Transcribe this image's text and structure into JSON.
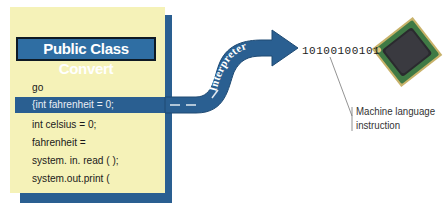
{
  "diagram": {
    "code_panel": {
      "title": "Public Class Convert",
      "lines": [
        "go",
        "{int fahrenheit = 0;",
        "int celsius = 0;",
        "fahrenheit =",
        "system. in. read ( );",
        "system.out.print ("
      ],
      "highlighted_line_index": 1
    },
    "arrow": {
      "label": "Interpreter"
    },
    "output": {
      "binary": "10100100101"
    },
    "processor": {
      "icon": "cpu-chip-icon"
    },
    "callout": {
      "label_line1": "Machine language",
      "label_line2": "instruction"
    },
    "colors": {
      "panel_bg": "#f5f2b8",
      "accent_blue": "#2a5f91",
      "title_blue": "#2f6ea3"
    }
  }
}
